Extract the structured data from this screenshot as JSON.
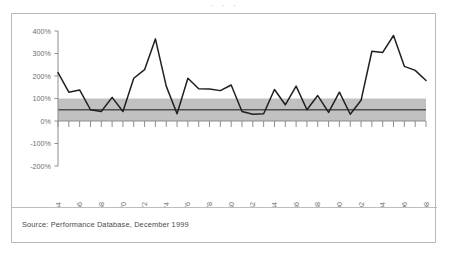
{
  "top_fragment": "· · ·",
  "source_note": "Source: Performance Database, December 1999",
  "colors": {
    "line": "#1f1f1f",
    "band_fill": "#b0b0b0",
    "band_reference_line": "#4f4f4f",
    "axis": "#8d8d8d",
    "frame_border": "#b9b9b9",
    "label_text": "#6d6d6d",
    "source_text": "#4a4a4a",
    "background": "#ffffff"
  },
  "chart_data": {
    "type": "line",
    "title": "",
    "subtitle": "",
    "xlabel": "",
    "ylabel": "",
    "xlim": [
      1964,
      1998
    ],
    "ylim": [
      -200,
      400
    ],
    "yticks": [
      -200,
      -100,
      0,
      100,
      200,
      300,
      400
    ],
    "ytick_labels": [
      "-200%",
      "-100%",
      "0%",
      "100%",
      "200%",
      "300%",
      "400%"
    ],
    "xticks": [
      1964,
      1966,
      1968,
      1970,
      1972,
      1974,
      1976,
      1978,
      1980,
      1982,
      1984,
      1986,
      1988,
      1990,
      1992,
      1994,
      1996,
      1998
    ],
    "xtick_labels": [
      "1964",
      "1966",
      "1968",
      "1970",
      "1972",
      "1974",
      "1976",
      "1978",
      "1980",
      "1982",
      "1984",
      "1986",
      "1988",
      "1990",
      "1992",
      "1994",
      "1996",
      "1998"
    ],
    "xtick_rotation": -90,
    "grid": false,
    "legend": null,
    "minor_xticks_every": 1,
    "shaded_band": {
      "label": "",
      "y_min": 0,
      "y_max": 100,
      "reference_line_y": 50
    },
    "x": [
      1964,
      1965,
      1966,
      1967,
      1968,
      1969,
      1970,
      1971,
      1972,
      1973,
      1974,
      1975,
      1976,
      1977,
      1978,
      1979,
      1980,
      1981,
      1982,
      1983,
      1984,
      1985,
      1986,
      1987,
      1988,
      1989,
      1990,
      1991,
      1992,
      1993,
      1994,
      1995,
      1996,
      1997,
      1998
    ],
    "series": [
      {
        "name": "Performance",
        "values": [
          215,
          128,
          138,
          50,
          42,
          105,
          42,
          190,
          228,
          365,
          155,
          32,
          190,
          143,
          142,
          135,
          160,
          42,
          30,
          32,
          140,
          72,
          155,
          50,
          113,
          38,
          128,
          30,
          92,
          310,
          305,
          380,
          243,
          225,
          180
        ]
      }
    ]
  }
}
